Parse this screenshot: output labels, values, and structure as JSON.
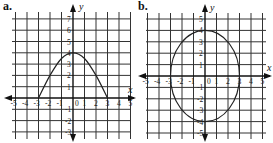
{
  "chart_data": [
    {
      "panel_label": "a.",
      "type": "line",
      "title": "",
      "xlabel": "x",
      "ylabel": "y",
      "xlim": [
        -5,
        5
      ],
      "ylim": [
        -3,
        7
      ],
      "x_ticks": [
        "-5",
        "-4",
        "-3",
        "-2",
        "-1",
        "0",
        "1",
        "2",
        "3",
        "4",
        "5"
      ],
      "y_ticks": [
        "7",
        "6",
        "5",
        "4",
        "3",
        "2",
        "1",
        "-1",
        "-2",
        "-3"
      ],
      "grid": true,
      "series": [
        {
          "name": "bell-shaped curve",
          "x": [
            -3,
            -2,
            -1,
            0,
            1,
            2,
            3
          ],
          "y": [
            0,
            2,
            3.5,
            4,
            3.5,
            2,
            0
          ]
        }
      ]
    },
    {
      "panel_label": "b.",
      "type": "line",
      "title": "",
      "xlabel": "x",
      "ylabel": "y",
      "xlim": [
        -5,
        5
      ],
      "ylim": [
        -5,
        5
      ],
      "x_ticks": [
        "-5",
        "-4",
        "-3",
        "-2",
        "-1",
        "0",
        "1",
        "2",
        "3",
        "4",
        "5"
      ],
      "y_ticks": [
        "5",
        "4",
        "3",
        "2",
        "1",
        "-1",
        "-2",
        "-3",
        "-4",
        "-5"
      ],
      "grid": true,
      "series": [
        {
          "name": "ellipse",
          "shape": "ellipse",
          "center": [
            0,
            0
          ],
          "x_radius": 3,
          "y_radius": 4
        }
      ]
    }
  ],
  "labels": {
    "a": "a.",
    "b": "b.",
    "x": "x",
    "y": "y"
  }
}
